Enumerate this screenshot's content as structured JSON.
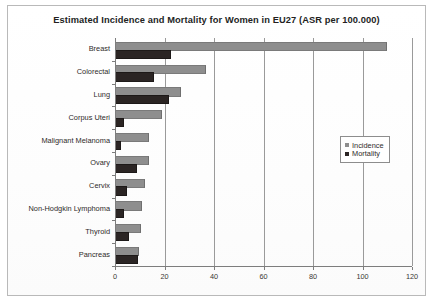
{
  "chart_data": {
    "type": "bar",
    "orientation": "horizontal",
    "title": "Estimated Incidence and Mortality for  Women in EU27 (ASR per 100.000)",
    "xlabel": "",
    "ylabel": "",
    "xlim": [
      0,
      120
    ],
    "xticks": [
      0,
      20,
      40,
      60,
      80,
      100,
      120
    ],
    "xtick_labels": [
      "0",
      "20",
      "40",
      "60",
      "80",
      "100",
      "120"
    ],
    "grid": true,
    "grid_axis": "x",
    "legend_position": "center-right",
    "categories": [
      "Breast",
      "Colorectal",
      "Lung",
      "Corpus Uteri",
      "Malignant Melanoma",
      "Ovary",
      "Cervix",
      "Non-Hodgkin Lymphoma",
      "Thyroid",
      "Pancreas"
    ],
    "series": [
      {
        "name": "Incidence",
        "color": "#8e8e8e",
        "values": [
          109,
          36,
          26,
          18,
          13,
          13,
          11.5,
          10,
          9.5,
          9
        ]
      },
      {
        "name": "Mortality",
        "color": "#2b2524",
        "values": [
          22,
          15,
          21,
          3,
          1.5,
          8,
          4,
          3,
          5,
          8.5
        ]
      }
    ]
  },
  "legend": {
    "entries": [
      {
        "label": "Incidence"
      },
      {
        "label": "Mortality"
      }
    ]
  }
}
